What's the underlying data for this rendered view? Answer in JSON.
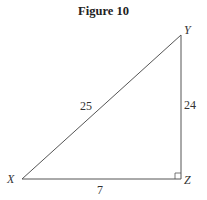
{
  "figure": {
    "title": "Figure 10",
    "vertices": [
      {
        "name": "X",
        "x": 22,
        "y": 179
      },
      {
        "name": "Y",
        "x": 181,
        "y": 35
      },
      {
        "name": "Z",
        "x": 181,
        "y": 179
      }
    ],
    "sides": {
      "XY": "25",
      "YZ": "24",
      "XZ": "7"
    },
    "right_angle_at": "Z",
    "line_color": "#555555"
  }
}
